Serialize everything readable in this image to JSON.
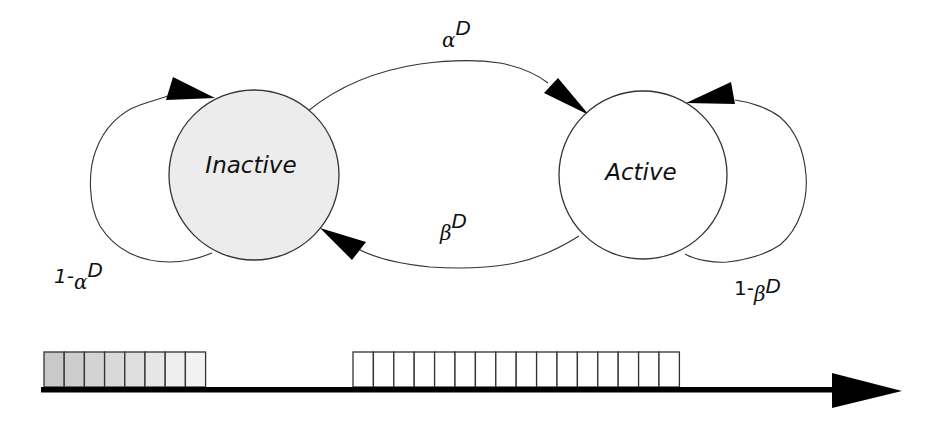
{
  "diagram": {
    "type": "two-state markov chain with timeline",
    "states": [
      {
        "id": "inactive",
        "label": "Inactive",
        "fill": "#ececec",
        "cx": 254,
        "cy": 175,
        "r": 85
      },
      {
        "id": "active",
        "label": "Active",
        "fill": "#ffffff",
        "cx": 643,
        "cy": 175,
        "r": 84
      }
    ],
    "transitions": [
      {
        "from": "inactive",
        "to": "inactive",
        "label": {
          "prefix": "1-",
          "symbol": "α",
          "sup": "D"
        }
      },
      {
        "from": "inactive",
        "to": "active",
        "label": {
          "prefix": "",
          "symbol": "α",
          "sup": "D"
        }
      },
      {
        "from": "active",
        "to": "inactive",
        "label": {
          "prefix": "",
          "symbol": "β",
          "sup": "D"
        }
      },
      {
        "from": "active",
        "to": "active",
        "label": {
          "prefix": "1-",
          "symbol": "β",
          "sup": "D"
        }
      }
    ],
    "timeline": {
      "inactive_block": {
        "cell_count": 8,
        "shading": "gradient grey fading to white",
        "colors": [
          "#c9c9c9",
          "#cdcdcd",
          "#d3d3d3",
          "#d8d8d8",
          "#dedede",
          "#e6e6e6",
          "#eeeeee",
          "#f2f2f2"
        ]
      },
      "active_block": {
        "cell_count": 16,
        "shading": "white",
        "color": "#ffffff"
      },
      "axis_color": "#000000"
    }
  }
}
